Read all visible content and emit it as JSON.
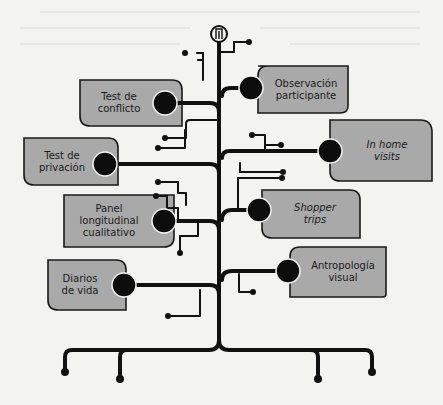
{
  "diagram": {
    "title_icon": "trunk-badge-icon",
    "colors": {
      "background": "#f3f3f1",
      "box_fill": "#a9a9a9",
      "box_stroke": "#1a1a1a",
      "line": "#111111",
      "node": "#0d0d0d"
    },
    "left_branches": [
      {
        "id": "test-conflicto",
        "line1": "Test de",
        "line2": "conflicto",
        "line3": "",
        "italic": false
      },
      {
        "id": "test-privacion",
        "line1": "Test de",
        "line2": "privación",
        "line3": "",
        "italic": false
      },
      {
        "id": "panel-longitudinal",
        "line1": "Panel",
        "line2": "longitudinal",
        "line3": "cualitativo",
        "italic": false
      },
      {
        "id": "diarios-vida",
        "line1": "Diarios",
        "line2": "de vida",
        "line3": "",
        "italic": false
      }
    ],
    "right_branches": [
      {
        "id": "observacion-participante",
        "line1": "Observación",
        "line2": "participante",
        "line3": "",
        "italic": false
      },
      {
        "id": "in-home-visits",
        "line1": "In home",
        "line2": "visits",
        "line3": "",
        "italic": true
      },
      {
        "id": "shopper-trips",
        "line1": "Shopper",
        "line2": "trips",
        "line3": "",
        "italic": true
      },
      {
        "id": "antropologia-visual",
        "line1": "Antropología",
        "line2": "visual",
        "line3": "",
        "italic": false
      }
    ]
  }
}
